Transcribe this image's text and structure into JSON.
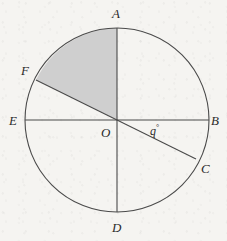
{
  "figure": {
    "kind": "circle-diagram",
    "background_color": "#f5f4f1",
    "stroke_color": "#4a4a4a",
    "shaded_sector_color": "#cfcfcf",
    "circle": {
      "center_label": "O",
      "center_x": 117,
      "center_y": 120,
      "radius": 92
    },
    "points": [
      {
        "id": "A",
        "label": "A",
        "x": 117,
        "y": 28,
        "label_x": 112,
        "label_y": 7,
        "description": "top of circle"
      },
      {
        "id": "B",
        "label": "B",
        "x": 209,
        "y": 120,
        "label_x": 211,
        "label_y": 114,
        "description": "right of circle"
      },
      {
        "id": "C",
        "label": "C",
        "x": 196,
        "y": 159,
        "label_x": 201,
        "label_y": 162,
        "description": "lower right on circle"
      },
      {
        "id": "D",
        "label": "D",
        "x": 117,
        "y": 212,
        "label_x": 112,
        "label_y": 221,
        "description": "bottom of circle"
      },
      {
        "id": "E",
        "label": "E",
        "x": 25,
        "y": 120,
        "label_x": 9,
        "label_y": 114,
        "description": "left of circle"
      },
      {
        "id": "F",
        "label": "F",
        "x": 36,
        "y": 80,
        "label_x": 21,
        "label_y": 64,
        "description": "upper left on circle"
      },
      {
        "id": "O",
        "label": "O",
        "x": 117,
        "y": 120,
        "label_x": 101,
        "label_y": 126,
        "description": "center of circle"
      }
    ],
    "diameters": [
      {
        "id": "AD",
        "from": "A",
        "to": "D",
        "orientation": "vertical"
      },
      {
        "id": "EB",
        "from": "E",
        "to": "B",
        "orientation": "horizontal"
      },
      {
        "id": "FC",
        "from": "F",
        "to": "C",
        "orientation": "oblique"
      }
    ],
    "shaded_sector": {
      "id": "AOF",
      "from_point": "F",
      "to_point": "A",
      "vertex": "O",
      "fill": "#cfcfcf"
    },
    "angle": {
      "id": "q",
      "symbol": "q",
      "degree_symbol": "°",
      "text": "q°",
      "vertex": "O",
      "between": [
        "B",
        "C"
      ],
      "label_x": 150,
      "label_y": 124
    }
  }
}
